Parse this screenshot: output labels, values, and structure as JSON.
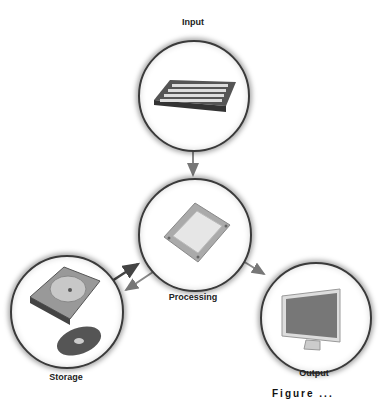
{
  "diagram": {
    "nodes": [
      {
        "id": "input",
        "label": "Input",
        "icon": "keyboard-icon"
      },
      {
        "id": "processing",
        "label": "Processing",
        "icon": "cpu-chip-icon"
      },
      {
        "id": "storage",
        "label": "Storage",
        "icon": "hard-drive-and-disc-icon"
      },
      {
        "id": "output",
        "label": "Output",
        "icon": "monitor-icon"
      }
    ],
    "edges": [
      {
        "from": "input",
        "to": "processing"
      },
      {
        "from": "storage",
        "to": "processing"
      },
      {
        "from": "processing",
        "to": "storage"
      },
      {
        "from": "processing",
        "to": "output"
      }
    ],
    "caption_fragment": "Figure ..."
  }
}
